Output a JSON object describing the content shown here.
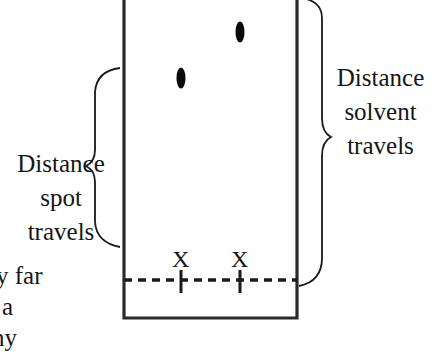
{
  "diagram": {
    "type": "thin-layer-chromatography-plate",
    "colors": {
      "stroke": "#222222",
      "spot": "#0a0a0a",
      "text": "#161616",
      "background": "#ffffff"
    },
    "plate": {
      "left": 123,
      "right": 298,
      "bottom": 318,
      "baseline_y": 280
    },
    "spots": [
      {
        "name": "spot-left",
        "cx": 181,
        "cy": 78,
        "rx": 4,
        "ry": 10
      },
      {
        "name": "spot-right",
        "cx": 240,
        "cy": 32,
        "rx": 4,
        "ry": 10
      }
    ],
    "origin_marks": [
      {
        "label": "X",
        "x": 181
      },
      {
        "label": "X",
        "x": 240
      }
    ],
    "left_label": {
      "lines": [
        "Distance",
        "spot",
        "travels"
      ]
    },
    "right_label": {
      "lines": [
        "Distance",
        "solvent",
        "travels"
      ]
    },
    "partial_text": {
      "lines": [
        "y far",
        "a",
        "ny"
      ]
    }
  }
}
